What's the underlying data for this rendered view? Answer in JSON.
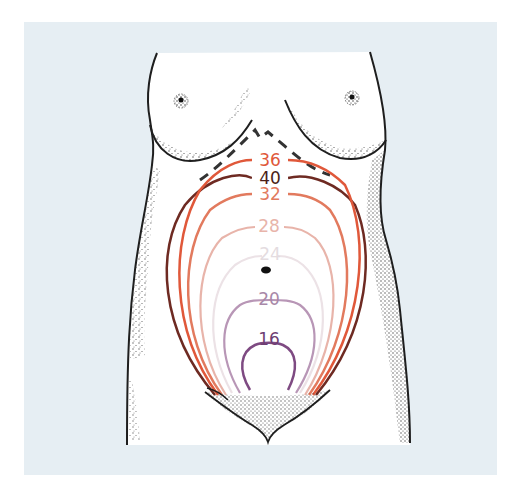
{
  "figure": {
    "background_color": "#e6eef3",
    "body_fill": "#ffffff",
    "outline_color": "#1e1e1e",
    "dash_label": "",
    "curves": [
      {
        "week": "36",
        "color": "#e0583a",
        "label_y": 160
      },
      {
        "week": "40",
        "color": "#6e2a22",
        "label_y": 178
      },
      {
        "week": "32",
        "color": "#e27a5e",
        "label_y": 194
      },
      {
        "week": "28",
        "color": "#e8b4aa",
        "label_y": 227
      },
      {
        "week": "24",
        "color": "#ece2e6",
        "label_y": 256
      },
      {
        "week": "20",
        "color": "#b896b6",
        "label_y": 300
      },
      {
        "week": "16",
        "color": "#7e4a82",
        "label_y": 340
      }
    ]
  }
}
